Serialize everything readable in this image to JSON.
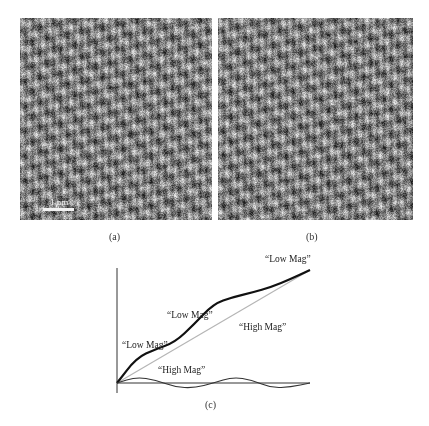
{
  "figure": {
    "panel_a": {
      "label": "(a)",
      "scale_bar_label": "1 nm",
      "description": "atomic-resolution lattice image"
    },
    "panel_b": {
      "label": "(b)",
      "description": "atomic-resolution lattice image"
    },
    "panel_c": {
      "label": "(c)",
      "annotations": [
        {
          "text": "“Low Mag”",
          "x": 265,
          "y": 254
        },
        {
          "text": "“Low Mag”",
          "x": 167,
          "y": 310
        },
        {
          "text": "“High Mag”",
          "x": 239,
          "y": 322
        },
        {
          "text": "“Low Mag”",
          "x": 122,
          "y": 340
        },
        {
          "text": "“High Mag”",
          "x": 158,
          "y": 365
        }
      ]
    }
  },
  "chart_data": {
    "type": "line",
    "title": "",
    "xlabel": "",
    "ylabel": "",
    "grid": false,
    "legend": "none",
    "series": [
      {
        "name": "ideal linear (gray)",
        "x": [
          0,
          1
        ],
        "y": [
          0,
          1
        ]
      },
      {
        "name": "Low Mag (measured, bold)",
        "x": [
          0,
          0.1,
          0.2,
          0.3,
          0.4,
          0.5,
          0.6,
          0.7,
          0.8,
          0.9,
          1.0
        ],
        "y": [
          0,
          0.22,
          0.3,
          0.36,
          0.52,
          0.7,
          0.76,
          0.8,
          0.85,
          0.92,
          1.0
        ]
      },
      {
        "name": "High Mag (deviation)",
        "x": [
          0,
          0.1,
          0.2,
          0.3,
          0.4,
          0.5,
          0.6,
          0.7,
          0.8,
          0.9,
          1.0
        ],
        "y": [
          0,
          0.06,
          0.03,
          -0.04,
          -0.05,
          0.0,
          0.06,
          0.03,
          -0.05,
          -0.04,
          0.0
        ]
      }
    ],
    "annotations": [
      "“Low Mag”",
      "“Low Mag”",
      "“High Mag”",
      "“Low Mag”",
      "“High Mag”"
    ]
  }
}
